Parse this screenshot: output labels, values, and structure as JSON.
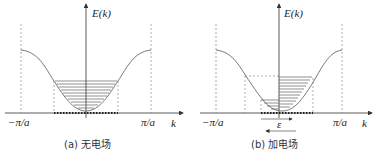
{
  "panels": [
    {
      "id": "a",
      "y_label": "E(k)",
      "x_label": "k",
      "left_tick": "−π/a",
      "right_tick": "π/a",
      "caption": "(a) 无电场"
    },
    {
      "id": "b",
      "y_label": "E(k)",
      "x_label": "k",
      "left_tick": "−π/a",
      "right_tick": "π/a",
      "field_label": "ε",
      "caption": "(b) 加电场"
    }
  ]
}
